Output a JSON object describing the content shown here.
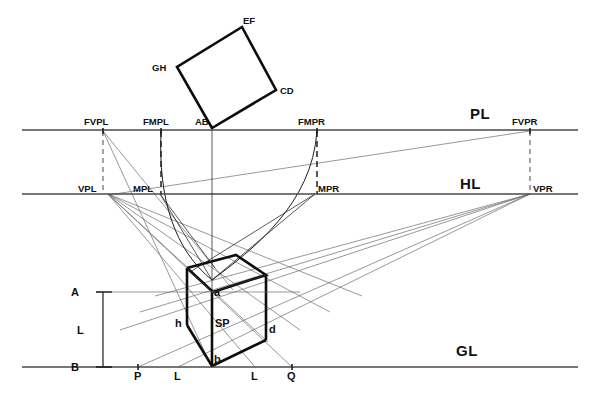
{
  "diagram": {
    "type": "technical-drawing",
    "canvas": {
      "width": 595,
      "height": 396
    },
    "colors": {
      "line": "#4a4a4a",
      "construction": "#6b6b6b",
      "heavy": "#0d0d0d",
      "background": "#ffffff"
    },
    "reference_lines": [
      {
        "id": "PL",
        "label": "PL",
        "y": 130,
        "x1": 22,
        "x2": 578,
        "label_x": 470,
        "label_y": 119
      },
      {
        "id": "HL",
        "label": "HL",
        "y": 194,
        "x1": 22,
        "x2": 578,
        "label_x": 460,
        "label_y": 189
      },
      {
        "id": "GL",
        "label": "GL",
        "y": 367,
        "x1": 22,
        "x2": 578,
        "label_x": 456,
        "label_y": 351
      }
    ],
    "pl_points": [
      {
        "label": "FVPL",
        "x": 103,
        "y": 130,
        "label_x": 84,
        "label_y": 125
      },
      {
        "label": "FMPL",
        "x": 161,
        "y": 130,
        "label_x": 143,
        "label_y": 125
      },
      {
        "label": "AB",
        "x": 212,
        "y": 130,
        "label_x": 195,
        "label_y": 125
      },
      {
        "label": "FMPR",
        "x": 317,
        "y": 130,
        "label_x": 298,
        "label_y": 125
      },
      {
        "label": "FVPR",
        "x": 530,
        "y": 130,
        "label_x": 512,
        "label_y": 125
      }
    ],
    "hl_points": [
      {
        "label": "VPL",
        "x": 108,
        "y": 194,
        "label_x": 78,
        "label_y": 192
      },
      {
        "label": "MPL",
        "x": 160,
        "y": 194,
        "label_x": 133,
        "label_y": 192
      },
      {
        "label": "MPR",
        "x": 315,
        "y": 194,
        "label_x": 317,
        "label_y": 192
      },
      {
        "label": "VPR",
        "x": 530,
        "y": 194,
        "label_x": 532,
        "label_y": 192
      }
    ],
    "gl_points": [
      {
        "label": "P",
        "x": 138,
        "y": 367,
        "label_x": 134,
        "label_y": 379
      },
      {
        "label": "L",
        "x": 178,
        "y": 367,
        "label_x": 174,
        "label_y": 379
      },
      {
        "label": "L",
        "x": 255,
        "y": 367,
        "label_x": 251,
        "label_y": 379
      },
      {
        "label": "Q",
        "x": 292,
        "y": 367,
        "label_x": 287,
        "label_y": 379
      }
    ],
    "plan_square": {
      "name": "rotated-plan-square",
      "vertices": [
        {
          "label": "AB",
          "x": 212,
          "y": 128,
          "label_x": 195,
          "label_y": 125
        },
        {
          "label": "GH",
          "x": 177,
          "y": 67,
          "label_x": 153,
          "label_y": 70
        },
        {
          "label": "EF",
          "x": 242,
          "y": 27,
          "label_x": 243,
          "label_y": 24
        },
        {
          "label": "CD",
          "x": 276,
          "y": 90,
          "label_x": 279,
          "label_y": 93
        }
      ]
    },
    "cube": {
      "name": "perspective-cube",
      "labels": [
        {
          "label": "a",
          "x": 213,
          "y": 292,
          "label_x": 214,
          "label_y": 294
        },
        {
          "label": "b",
          "x": 212,
          "y": 366,
          "label_x": 213,
          "label_y": 362
        },
        {
          "label": "d",
          "x": 266,
          "y": 340,
          "label_x": 268,
          "label_y": 331
        },
        {
          "label": "h",
          "x": 187,
          "y": 325,
          "label_x": 176,
          "label_y": 324
        },
        {
          "label": "SP",
          "x": 218,
          "y": 320,
          "label_x": 216,
          "label_y": 325
        }
      ]
    },
    "dimension": {
      "name": "height-dimension-L",
      "top_label": "A",
      "bottom_label": "B",
      "length_label": "L",
      "x": 103,
      "y_top": 292,
      "y_bottom": 367,
      "top_label_x": 72,
      "top_label_y": 296,
      "bottom_label_x": 72,
      "bottom_label_y": 371,
      "length_label_x": 78,
      "length_label_y": 333
    }
  }
}
